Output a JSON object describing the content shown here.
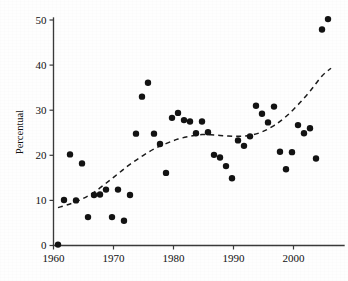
{
  "chart_data": {
    "type": "scatter",
    "title": "",
    "subtitle": "",
    "xlabel": "",
    "ylabel": "Percentual",
    "xlim": [
      1959,
      2007
    ],
    "ylim": [
      0,
      52
    ],
    "xticks": [
      1960,
      1970,
      1980,
      1990,
      2000
    ],
    "xtick_labels": [
      "1960",
      "1970",
      "1980",
      "1990",
      "2000"
    ],
    "yticks": [
      0,
      10,
      20,
      30,
      40,
      50
    ],
    "ytick_labels": [
      "0",
      "10",
      "20",
      "30",
      "40",
      "50"
    ],
    "grid": false,
    "legend": null,
    "point_color": "#131313",
    "point_radius": 3.2,
    "axis_color": "#3a3a3a",
    "background_color": "#fefefe",
    "series": [
      {
        "name": "observations",
        "marker": "filled-circle",
        "x": [
          1960,
          1961,
          1962,
          1963,
          1964,
          1965,
          1966,
          1967,
          1968,
          1969,
          1970,
          1971,
          1972,
          1973,
          1974,
          1975,
          1976,
          1977,
          1978,
          1979,
          1980,
          1981,
          1982,
          1983,
          1984,
          1985,
          1986,
          1987,
          1988,
          1989,
          1990,
          1991,
          1992,
          1993,
          1994,
          1995,
          1996,
          1997,
          1998,
          1999,
          2000,
          2001,
          2002,
          2003,
          2004,
          2005
        ],
        "y": [
          0.2,
          10.1,
          20.2,
          10.0,
          18.2,
          6.3,
          11.2,
          11.3,
          12.4,
          6.3,
          12.4,
          5.5,
          11.2,
          24.8,
          33.0,
          36.1,
          24.8,
          22.5,
          16.1,
          28.3,
          29.4,
          27.8,
          27.5,
          24.9,
          27.5,
          25.1,
          20.1,
          19.5,
          17.6,
          14.9,
          23.3,
          22.1,
          24.2,
          31.0,
          29.2,
          27.3,
          30.8,
          20.8,
          16.9,
          20.7,
          26.7,
          24.9,
          26.0,
          19.3,
          47.9,
          50.2
        ]
      }
    ],
    "trend": {
      "name": "smoothed-trend",
      "style": "dashed",
      "x": [
        1960,
        1962,
        1964,
        1966,
        1968,
        1970,
        1972,
        1974,
        1976,
        1978,
        1980,
        1982,
        1984,
        1986,
        1988,
        1990,
        1992,
        1994,
        1996,
        1998,
        2000,
        2002,
        2004,
        2005.5
      ],
      "y": [
        8.4,
        9.2,
        10.3,
        11.8,
        13.8,
        15.9,
        18.0,
        19.8,
        21.4,
        22.6,
        23.6,
        24.2,
        24.6,
        24.5,
        24.3,
        24.2,
        24.4,
        25.2,
        26.6,
        28.6,
        31.2,
        34.2,
        37.6,
        39.3
      ]
    }
  },
  "axes": {
    "y_axis_title": "Percentual"
  }
}
